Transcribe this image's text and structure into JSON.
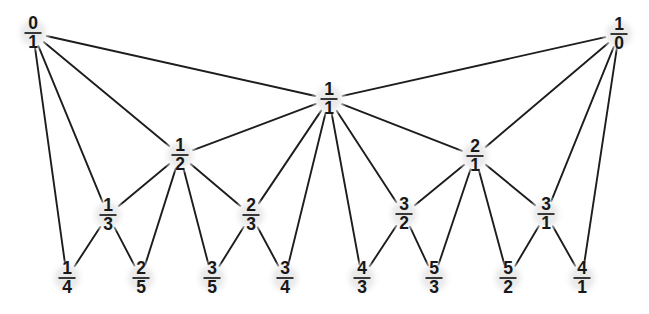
{
  "figure": {
    "background_color": "#ffffff",
    "edge_color": "#1d1d1d",
    "node_halo_color": "#ebebeb",
    "text_color": "#181818",
    "width": 649,
    "height": 314
  },
  "nodes": [
    {
      "id": "0/1",
      "numerator": "0",
      "denominator": "1",
      "x": 33,
      "y": 33,
      "level": 0,
      "radius": 19
    },
    {
      "id": "1/0",
      "numerator": "1",
      "denominator": "0",
      "x": 619,
      "y": 34,
      "level": 0,
      "radius": 19
    },
    {
      "id": "1/1",
      "numerator": "1",
      "denominator": "1",
      "x": 329,
      "y": 99,
      "level": 1,
      "radius": 19
    },
    {
      "id": "1/2",
      "numerator": "1",
      "denominator": "2",
      "x": 180,
      "y": 155,
      "level": 2,
      "radius": 19
    },
    {
      "id": "2/1",
      "numerator": "2",
      "denominator": "1",
      "x": 475,
      "y": 156,
      "level": 2,
      "radius": 19
    },
    {
      "id": "1/3",
      "numerator": "1",
      "denominator": "3",
      "x": 108,
      "y": 215,
      "level": 3,
      "radius": 19
    },
    {
      "id": "2/3",
      "numerator": "2",
      "denominator": "3",
      "x": 251,
      "y": 215,
      "level": 3,
      "radius": 19
    },
    {
      "id": "3/2",
      "numerator": "3",
      "denominator": "2",
      "x": 404,
      "y": 214,
      "level": 3,
      "radius": 19
    },
    {
      "id": "3/1",
      "numerator": "3",
      "denominator": "1",
      "x": 546,
      "y": 214,
      "level": 3,
      "radius": 19
    },
    {
      "id": "1/4",
      "numerator": "1",
      "denominator": "4",
      "x": 67,
      "y": 278,
      "level": 4,
      "radius": 19
    },
    {
      "id": "2/5",
      "numerator": "2",
      "denominator": "5",
      "x": 141,
      "y": 278,
      "level": 4,
      "radius": 19
    },
    {
      "id": "3/5",
      "numerator": "3",
      "denominator": "5",
      "x": 212,
      "y": 278,
      "level": 4,
      "radius": 19
    },
    {
      "id": "3/4",
      "numerator": "3",
      "denominator": "4",
      "x": 285,
      "y": 278,
      "level": 4,
      "radius": 19
    },
    {
      "id": "4/3",
      "numerator": "4",
      "denominator": "3",
      "x": 362,
      "y": 278,
      "level": 4,
      "radius": 19
    },
    {
      "id": "5/3",
      "numerator": "5",
      "denominator": "3",
      "x": 434,
      "y": 278,
      "level": 4,
      "radius": 19
    },
    {
      "id": "5/2",
      "numerator": "5",
      "denominator": "2",
      "x": 508,
      "y": 278,
      "level": 4,
      "radius": 19
    },
    {
      "id": "4/1",
      "numerator": "4",
      "denominator": "1",
      "x": 582,
      "y": 278,
      "level": 4,
      "radius": 19
    }
  ],
  "edges": [
    {
      "from": "0/1",
      "to": "1/1"
    },
    {
      "from": "0/1",
      "to": "1/2"
    },
    {
      "from": "0/1",
      "to": "1/3"
    },
    {
      "from": "0/1",
      "to": "1/4"
    },
    {
      "from": "1/0",
      "to": "1/1"
    },
    {
      "from": "1/0",
      "to": "2/1"
    },
    {
      "from": "1/0",
      "to": "3/1"
    },
    {
      "from": "1/0",
      "to": "4/1"
    },
    {
      "from": "1/1",
      "to": "1/2"
    },
    {
      "from": "1/1",
      "to": "2/1"
    },
    {
      "from": "1/1",
      "to": "2/3"
    },
    {
      "from": "1/1",
      "to": "3/2"
    },
    {
      "from": "1/1",
      "to": "3/4"
    },
    {
      "from": "1/1",
      "to": "4/3"
    },
    {
      "from": "1/2",
      "to": "1/3"
    },
    {
      "from": "1/2",
      "to": "2/3"
    },
    {
      "from": "1/2",
      "to": "2/5"
    },
    {
      "from": "1/2",
      "to": "3/5"
    },
    {
      "from": "2/1",
      "to": "3/2"
    },
    {
      "from": "2/1",
      "to": "3/1"
    },
    {
      "from": "2/1",
      "to": "5/3"
    },
    {
      "from": "2/1",
      "to": "5/2"
    },
    {
      "from": "1/3",
      "to": "1/4"
    },
    {
      "from": "1/3",
      "to": "2/5"
    },
    {
      "from": "2/3",
      "to": "3/5"
    },
    {
      "from": "2/3",
      "to": "3/4"
    },
    {
      "from": "3/2",
      "to": "4/3"
    },
    {
      "from": "3/2",
      "to": "5/3"
    },
    {
      "from": "3/1",
      "to": "5/2"
    },
    {
      "from": "3/1",
      "to": "4/1"
    }
  ]
}
